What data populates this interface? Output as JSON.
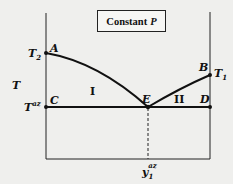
{
  "title": {
    "text": "Constant",
    "var": "P"
  },
  "axes": {
    "y_label": "T"
  },
  "points": {
    "A": "A",
    "B": "B",
    "C": "C",
    "D": "D",
    "E": "E"
  },
  "temperatures": {
    "T2": {
      "base": "T",
      "sub": "2"
    },
    "T1": {
      "base": "T",
      "sub": "1"
    },
    "Taz": {
      "base": "T",
      "sup": "az"
    }
  },
  "regions": {
    "I": "I",
    "II": "II"
  },
  "composition": {
    "base": "y",
    "sub": "1",
    "sup": "az"
  },
  "colors": {
    "line": "#111111",
    "background": "#efefed"
  }
}
